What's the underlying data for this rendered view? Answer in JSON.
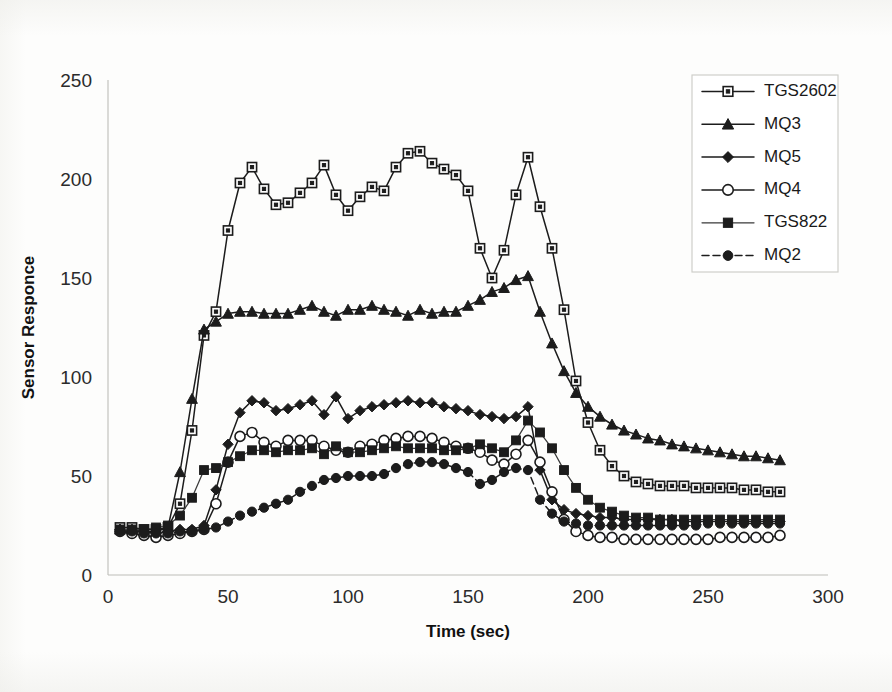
{
  "chart_data": {
    "type": "line",
    "title": "",
    "xlabel": "Time (sec)",
    "ylabel": "Sensor Responce",
    "xlim": [
      0,
      300
    ],
    "ylim": [
      0,
      250
    ],
    "xticks": [
      0,
      50,
      100,
      150,
      200,
      250,
      300
    ],
    "yticks": [
      0,
      50,
      100,
      150,
      200,
      250
    ],
    "grid": false,
    "legend_position": "top-right",
    "x": [
      5,
      10,
      15,
      20,
      25,
      30,
      35,
      40,
      45,
      50,
      55,
      60,
      65,
      70,
      75,
      80,
      85,
      90,
      95,
      100,
      105,
      110,
      115,
      120,
      125,
      130,
      135,
      140,
      145,
      150,
      155,
      160,
      165,
      170,
      175,
      180,
      185,
      190,
      195,
      200,
      205,
      210,
      215,
      220,
      225,
      230,
      235,
      240,
      245,
      250,
      255,
      260,
      265,
      270,
      275,
      280
    ],
    "series": [
      {
        "name": "TGS2602",
        "marker": "open-square",
        "line": "solid",
        "values": [
          24,
          24,
          23,
          23,
          24,
          36,
          73,
          121,
          133,
          174,
          198,
          206,
          195,
          187,
          188,
          193,
          198,
          207,
          192,
          184,
          191,
          196,
          194,
          206,
          213,
          214,
          208,
          205,
          202,
          194,
          165,
          150,
          164,
          192,
          211,
          186,
          165,
          134,
          98,
          77,
          63,
          55,
          50,
          47,
          46,
          45,
          45,
          45,
          44,
          44,
          44,
          44,
          43,
          43,
          42,
          42
        ]
      },
      {
        "name": "MQ3",
        "marker": "filled-triangle",
        "line": "solid",
        "values": [
          23,
          23,
          22,
          22,
          24,
          52,
          89,
          124,
          128,
          132,
          133,
          133,
          132,
          132,
          132,
          134,
          136,
          133,
          131,
          134,
          134,
          136,
          134,
          133,
          131,
          134,
          132,
          133,
          133,
          136,
          139,
          143,
          145,
          149,
          151,
          133,
          117,
          103,
          92,
          85,
          80,
          76,
          73,
          71,
          69,
          68,
          66,
          65,
          64,
          63,
          62,
          61,
          60,
          60,
          59,
          58
        ]
      },
      {
        "name": "MQ5",
        "marker": "filled-diamond",
        "line": "solid",
        "values": [
          23,
          22,
          22,
          21,
          22,
          23,
          23,
          25,
          43,
          66,
          82,
          88,
          87,
          83,
          84,
          86,
          88,
          81,
          90,
          79,
          83,
          85,
          86,
          87,
          88,
          87,
          87,
          85,
          84,
          83,
          81,
          80,
          79,
          80,
          85,
          53,
          38,
          33,
          31,
          30,
          29,
          29,
          28,
          28,
          28,
          28,
          28,
          27,
          27,
          27,
          27,
          27,
          27,
          27,
          27,
          27
        ]
      },
      {
        "name": "MQ4",
        "marker": "open-circle",
        "line": "solid",
        "values": [
          22,
          21,
          20,
          19,
          20,
          21,
          22,
          23,
          36,
          57,
          70,
          72,
          67,
          65,
          68,
          68,
          68,
          65,
          63,
          62,
          65,
          66,
          68,
          69,
          70,
          70,
          69,
          67,
          65,
          64,
          62,
          58,
          56,
          61,
          68,
          57,
          42,
          28,
          22,
          20,
          19,
          19,
          18,
          18,
          18,
          18,
          18,
          18,
          18,
          18,
          19,
          19,
          19,
          19,
          19,
          20
        ]
      },
      {
        "name": "TGS822",
        "marker": "filled-square",
        "line": "solid",
        "values": [
          23,
          23,
          23,
          24,
          25,
          30,
          39,
          53,
          54,
          57,
          60,
          63,
          63,
          62,
          63,
          63,
          64,
          61,
          65,
          62,
          62,
          63,
          64,
          65,
          64,
          64,
          64,
          63,
          63,
          64,
          66,
          64,
          62,
          68,
          78,
          72,
          64,
          53,
          44,
          38,
          34,
          32,
          30,
          29,
          29,
          28,
          28,
          28,
          28,
          28,
          28,
          28,
          28,
          28,
          28,
          28
        ]
      },
      {
        "name": "MQ2",
        "marker": "filled-circle",
        "line": "dashed",
        "values": [
          22,
          22,
          21,
          21,
          21,
          22,
          22,
          23,
          24,
          27,
          30,
          32,
          34,
          36,
          38,
          42,
          45,
          48,
          49,
          50,
          50,
          50,
          51,
          54,
          56,
          57,
          57,
          56,
          54,
          52,
          46,
          48,
          52,
          54,
          53,
          38,
          31,
          27,
          26,
          25,
          25,
          25,
          25,
          25,
          25,
          25,
          25,
          25,
          25,
          26,
          26,
          26,
          26,
          26,
          26,
          26
        ]
      }
    ]
  },
  "legend": {
    "items": [
      {
        "label": "TGS2602"
      },
      {
        "label": "MQ3"
      },
      {
        "label": "MQ5"
      },
      {
        "label": "MQ4"
      },
      {
        "label": "TGS822"
      },
      {
        "label": "MQ2"
      }
    ]
  }
}
